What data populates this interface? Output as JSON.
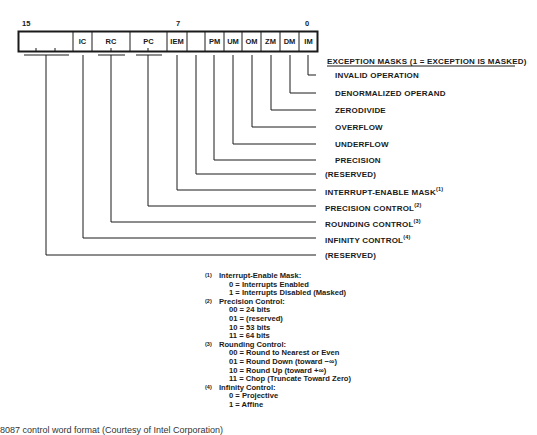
{
  "register": {
    "bit_labels": {
      "high": "15",
      "mid": "7",
      "low": "0"
    },
    "cells": [
      {
        "label": ""
      },
      {
        "label": "IC"
      },
      {
        "label": "RC"
      },
      {
        "label": "PC"
      },
      {
        "label": "IEM"
      },
      {
        "label": ""
      },
      {
        "label": "PM"
      },
      {
        "label": "UM"
      },
      {
        "label": "OM"
      },
      {
        "label": "ZM"
      },
      {
        "label": "DM"
      },
      {
        "label": "IM"
      }
    ]
  },
  "exception_header": "EXCEPTION MASKS (1 = EXCEPTION IS MASKED)",
  "fields": [
    {
      "label": "INVALID OPERATION",
      "sup": ""
    },
    {
      "label": "DENORMALIZED OPERAND",
      "sup": ""
    },
    {
      "label": "ZERODIVIDE",
      "sup": ""
    },
    {
      "label": "OVERFLOW",
      "sup": ""
    },
    {
      "label": "UNDERFLOW",
      "sup": ""
    },
    {
      "label": "PRECISION",
      "sup": ""
    },
    {
      "label": "(RESERVED)",
      "sup": ""
    },
    {
      "label": "INTERRUPT-ENABLE MASK",
      "sup": "(1)"
    },
    {
      "label": "PRECISION CONTROL",
      "sup": "(2)"
    },
    {
      "label": "ROUNDING CONTROL",
      "sup": "(3)"
    },
    {
      "label": "INFINITY CONTROL",
      "sup": "(4)"
    },
    {
      "label": "(RESERVED)",
      "sup": ""
    }
  ],
  "notes": [
    {
      "num": "(1)",
      "title": "Interrupt-Enable Mask:",
      "items": [
        "0 = Interrupts Enabled",
        "1 = Interrupts Disabled (Masked)"
      ]
    },
    {
      "num": "(2)",
      "title": "Precision Control:",
      "items": [
        "00 = 24 bits",
        "01 = (reserved)",
        "10 = 53 bits",
        "11 = 64 bits"
      ]
    },
    {
      "num": "(3)",
      "title": "Rounding Control:",
      "items": [
        "00 = Round to Nearest or Even",
        "01 = Round Down (toward −∞)",
        "10 = Round Up (toward +∞)",
        "11 = Chop (Truncate Toward Zero)"
      ]
    },
    {
      "num": "(4)",
      "title": "Infinity Control:",
      "items": [
        "0 = Projective",
        "1 = Affine"
      ]
    }
  ],
  "caption": "8087 control word format (Courtesy of Intel Corporation)"
}
